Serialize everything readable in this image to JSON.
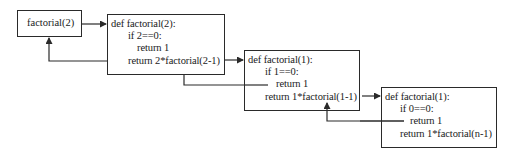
{
  "diagram": {
    "type": "recursion-trace",
    "call_box": {
      "label": "factorial(2)"
    },
    "frames": [
      {
        "header": "def factorial(2):",
        "condition": "if 2==0:",
        "base_return": "return 1",
        "recursive_return": "return 2*factorial(2-1)"
      },
      {
        "header": "def factorial(1):",
        "condition": "if 1==0:",
        "base_return": "return 1",
        "recursive_return": "return 1*factorial(1-1)"
      },
      {
        "header": "def factorial(1):",
        "condition": "if 0==0:",
        "base_return": "return 1",
        "recursive_return": "return 1*factorial(n-1)"
      }
    ],
    "colors": {
      "stroke": "#2a2a2a",
      "text": "#1a1a1a",
      "background": "#ffffff"
    }
  }
}
